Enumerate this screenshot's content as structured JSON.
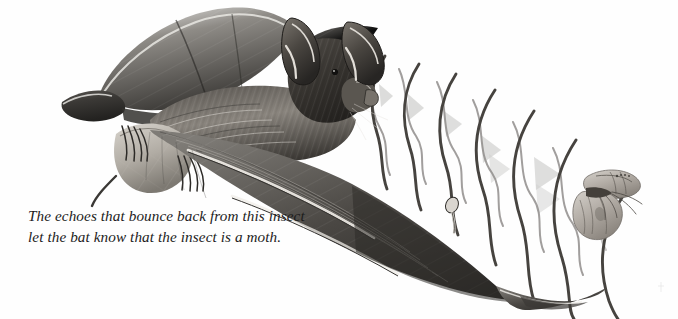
{
  "figure": {
    "medium": "pencil drawing",
    "background_color": "#fefefe",
    "ink_color": "#3f3f3f"
  },
  "caption": {
    "line1": "The echoes that bounce back from this insect",
    "line2": "let the bat know that the insect is a moth."
  },
  "subjects": {
    "bat": {
      "label": "bat",
      "description": "Flying bat with outstretched wings and large ears, facing right",
      "fur_color": "#4d4a46",
      "wing_color": "#6a6763",
      "parts": [
        "left-wing",
        "right-wing",
        "body",
        "head",
        "ear-left",
        "ear-right",
        "feet",
        "wing-finger-bones",
        "tail-membrane"
      ]
    },
    "moth": {
      "label": "moth",
      "description": "Small moth in flight to the right of the bat",
      "body_color": "#8c8782",
      "wing_color": "#b3aea8"
    }
  },
  "sound": {
    "outgoing_label": "outgoing echolocation calls",
    "outgoing_color": "#4a4745",
    "outgoing_wave_count": 9,
    "returning_label": "returning echoes",
    "returning_color": "#8d8a88",
    "returning_wave_count": 7,
    "cone_label": "sound cone wedges",
    "cone_color": "#c9c9c7",
    "cone_count": 7
  }
}
